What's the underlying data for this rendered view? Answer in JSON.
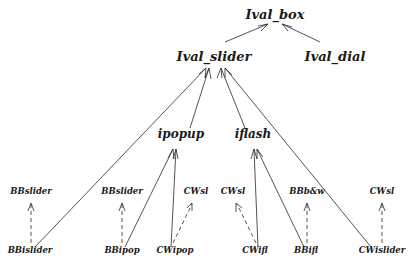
{
  "diagram": {
    "type": "class-inheritance-tree",
    "nodes": {
      "ival_box": "Ival_box",
      "ival_slider": "Ival_slider",
      "ival_dial": "Ival_dial",
      "ipopup": "ipopup",
      "iflash": "iflash",
      "bbslider_1": "BBslider",
      "bbslider_2": "BBslider",
      "cwsl_1": "CWsl",
      "cwsl_2": "CWsl",
      "bbbw": "BBb&w",
      "cwsl_3": "CWsl",
      "bbislider": "BBislider",
      "bbipop": "BBipop",
      "cwipop": "CWipop",
      "cwifl": "CWifl",
      "bbifl": "BBifl",
      "cwislider": "CWislider"
    },
    "edges": [
      {
        "from": "Ival_slider",
        "to": "Ival_box",
        "style": "solid"
      },
      {
        "from": "Ival_dial",
        "to": "Ival_box",
        "style": "solid"
      },
      {
        "from": "ipopup",
        "to": "Ival_slider",
        "style": "solid"
      },
      {
        "from": "iflash",
        "to": "Ival_slider",
        "style": "solid"
      },
      {
        "from": "BBislider",
        "to": "Ival_slider",
        "style": "solid"
      },
      {
        "from": "CWislider",
        "to": "Ival_slider",
        "style": "solid"
      },
      {
        "from": "BBipop",
        "to": "ipopup",
        "style": "solid"
      },
      {
        "from": "CWipop",
        "to": "ipopup",
        "style": "solid"
      },
      {
        "from": "CWifl",
        "to": "iflash",
        "style": "solid"
      },
      {
        "from": "BBifl",
        "to": "iflash",
        "style": "solid"
      },
      {
        "from": "BBislider",
        "to": "BBslider",
        "style": "dashed"
      },
      {
        "from": "BBipop",
        "to": "BBslider",
        "style": "dashed"
      },
      {
        "from": "CWipop",
        "to": "CWsl",
        "style": "dashed"
      },
      {
        "from": "CWifl",
        "to": "CWsl",
        "style": "dashed"
      },
      {
        "from": "BBifl",
        "to": "BBb&w",
        "style": "dashed"
      },
      {
        "from": "CWislider",
        "to": "CWsl",
        "style": "dashed"
      }
    ]
  }
}
